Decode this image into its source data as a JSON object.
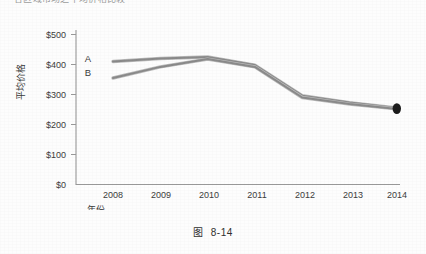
{
  "page": {
    "cut_off_heading": "各区域市场之平均价格比较"
  },
  "caption": {
    "label": "图",
    "number": "8-14"
  },
  "chart_data": {
    "type": "line",
    "title": "",
    "xlabel": "年份",
    "ylabel": "平均价格",
    "categories": [
      "2008",
      "2009",
      "2010",
      "2011",
      "2012",
      "2013",
      "2014"
    ],
    "ylim": [
      0,
      500
    ],
    "ytick_labels": [
      "$0",
      "$100",
      "$200",
      "$300",
      "$400",
      "$500"
    ],
    "ytick_values": [
      0,
      100,
      200,
      300,
      400,
      500
    ],
    "grid": false,
    "legend_position": "inline-left",
    "series": [
      {
        "name": "A",
        "label": "A",
        "color": "#8a8a8a",
        "values": [
          410,
          420,
          425,
          398,
          296,
          273,
          255
        ]
      },
      {
        "name": "B",
        "label": "B",
        "color": "#8a8a8a",
        "values": [
          355,
          392,
          418,
          392,
          290,
          268,
          252
        ]
      }
    ],
    "annotations": [
      {
        "name": "endpoint-marker",
        "series": "A",
        "x": "2014",
        "y": 253,
        "shape": "filled-ellipse",
        "color": "#1c1c1c"
      }
    ]
  },
  "colors": {
    "axis": "#9a9a9a",
    "line": "#8a8a8a",
    "line_shadow": "#b4b4b4",
    "marker": "#1c1c1c",
    "text": "#3a3a3a",
    "background": "#fdfdfd"
  }
}
